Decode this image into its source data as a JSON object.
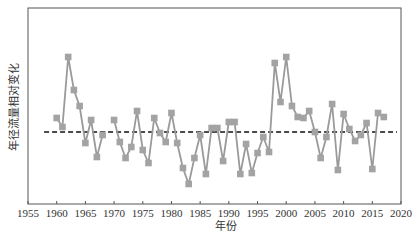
{
  "chart_data": {
    "type": "line",
    "title": "",
    "xlabel": "年份",
    "ylabel": "年径流量相对变化",
    "xlim": [
      1955,
      2020
    ],
    "ylim": [
      -7.2,
      12.4
    ],
    "x_ticks": [
      1955,
      1960,
      1965,
      1970,
      1975,
      1980,
      1985,
      1990,
      1995,
      2000,
      2005,
      2010,
      2015,
      2020
    ],
    "y_ticks": [],
    "grid": false,
    "legend": null,
    "units_note": "y axis unlabeled; values are relative anomaly units (0 = dashed reference line)",
    "reference_line": {
      "y": 0,
      "style": "dashed",
      "color": "#111111",
      "x_start": 1957.8,
      "x_end": 2019.3
    },
    "series": [
      {
        "name": "年径流量相对变化",
        "color": "#9a9a9a",
        "marker": "square",
        "x": [
          1960,
          1961,
          1962,
          1963,
          1964,
          1965,
          1966,
          1967,
          1968,
          1970,
          1971,
          1972,
          1973,
          1974,
          1975,
          1976,
          1977,
          1978,
          1979,
          1980,
          1981,
          1982,
          1983,
          1984,
          1985,
          1986,
          1987,
          1988,
          1989,
          1990,
          1991,
          1992,
          1993,
          1994,
          1995,
          1996,
          1997,
          1998,
          1999,
          2000,
          2001,
          2002,
          2003,
          2004,
          2005,
          2006,
          2007,
          2008,
          2009,
          2010,
          2011,
          2012,
          2013,
          2014,
          2015,
          2016,
          2017
        ],
        "values": [
          1.4,
          0.5,
          7.5,
          4.2,
          2.6,
          -1.1,
          1.2,
          -2.5,
          -0.3,
          1.2,
          -1.0,
          -2.6,
          -1.5,
          2.1,
          -1.8,
          -3.1,
          1.4,
          -0.1,
          -1.0,
          1.9,
          -1.1,
          -3.6,
          -5.2,
          -2.6,
          -0.3,
          -4.2,
          0.4,
          0.4,
          -2.9,
          1.0,
          1.0,
          -4.2,
          -1.2,
          -4.1,
          -2.1,
          -0.5,
          -2.0,
          6.9,
          3.0,
          7.5,
          2.6,
          1.5,
          1.4,
          2.1,
          0.0,
          -2.6,
          -0.5,
          2.8,
          -3.8,
          1.8,
          0.3,
          -0.9,
          -0.3,
          0.9,
          -3.7,
          1.9,
          1.5
        ]
      }
    ]
  },
  "axes": {
    "xlabel": "年份",
    "ylabel": "年径流量相对变化",
    "x_tick_labels": [
      "1955",
      "1960",
      "1965",
      "1970",
      "1975",
      "1980",
      "1985",
      "1990",
      "1995",
      "2000",
      "2005",
      "2010",
      "2015",
      "2020"
    ]
  }
}
